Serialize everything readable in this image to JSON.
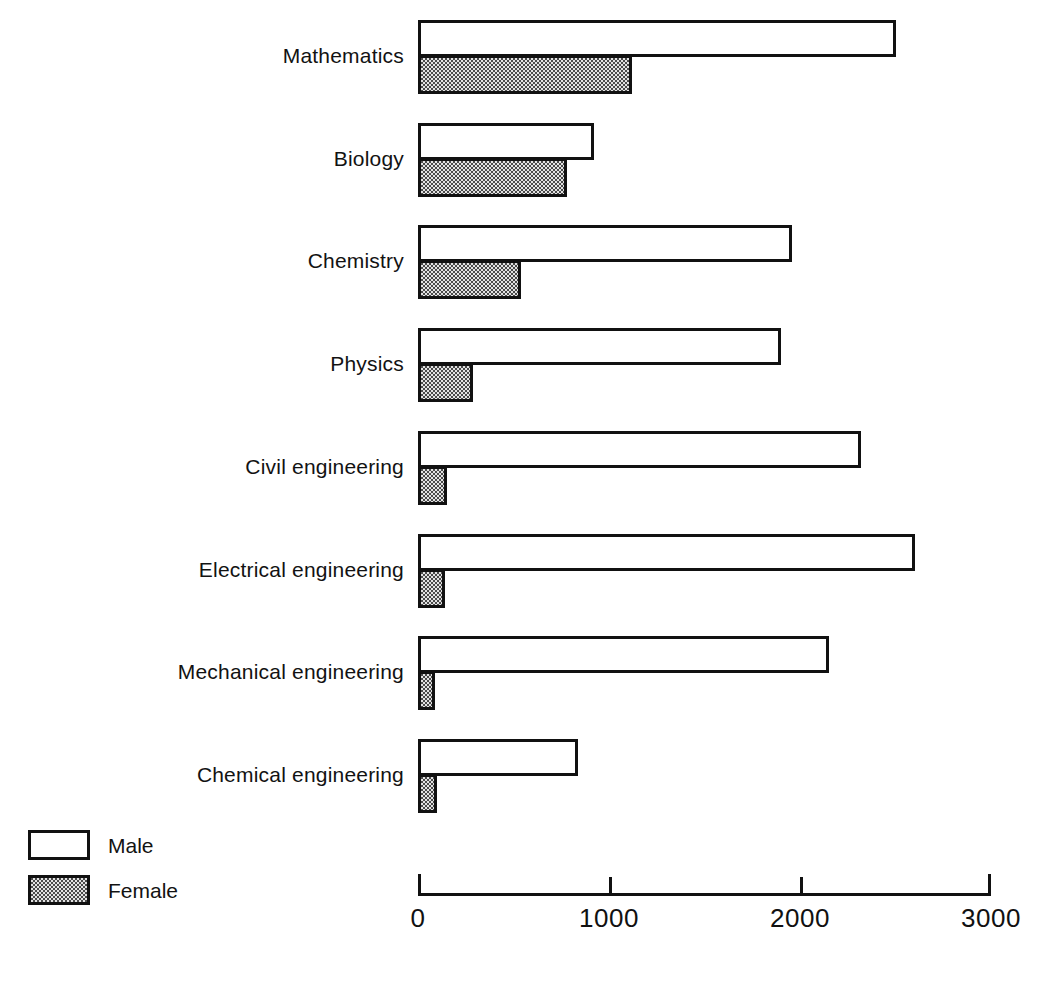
{
  "chart_data": {
    "type": "bar",
    "orientation": "horizontal",
    "grouped": true,
    "title": "",
    "subtitle": "",
    "xlabel": "",
    "ylabel": "",
    "xlim": [
      0,
      3000
    ],
    "xticks": [
      0,
      1000,
      2000,
      3000
    ],
    "xtick_labels": [
      "0",
      "1000",
      "2000",
      "3000"
    ],
    "grid": false,
    "legend_position": "bottom-left",
    "categories": [
      "Mathematics",
      "Biology",
      "Chemistry",
      "Physics",
      "Civil engineering",
      "Electrical engineering",
      "Mechanical engineering",
      "Chemical engineering"
    ],
    "series": [
      {
        "name": "Male",
        "fill": "white",
        "values": [
          2500,
          920,
          1960,
          1900,
          2320,
          2600,
          2150,
          840
        ]
      },
      {
        "name": "Female",
        "fill": "stipple",
        "values": [
          1120,
          780,
          540,
          290,
          150,
          140,
          90,
          100
        ]
      }
    ]
  },
  "axis": {
    "ticks": [
      {
        "label": "0",
        "value": 0
      },
      {
        "label": "1000",
        "value": 1000
      },
      {
        "label": "2000",
        "value": 2000
      },
      {
        "label": "3000",
        "value": 3000
      }
    ]
  },
  "legend": {
    "items": [
      {
        "label": "Male",
        "swatch": "white-box-swatch"
      },
      {
        "label": "Female",
        "swatch": "stippled-box-swatch"
      }
    ]
  },
  "colors": {
    "ink": "#111111",
    "background": "#ffffff",
    "female_fill": "#e2e2e2",
    "male_fill": "#ffffff"
  }
}
